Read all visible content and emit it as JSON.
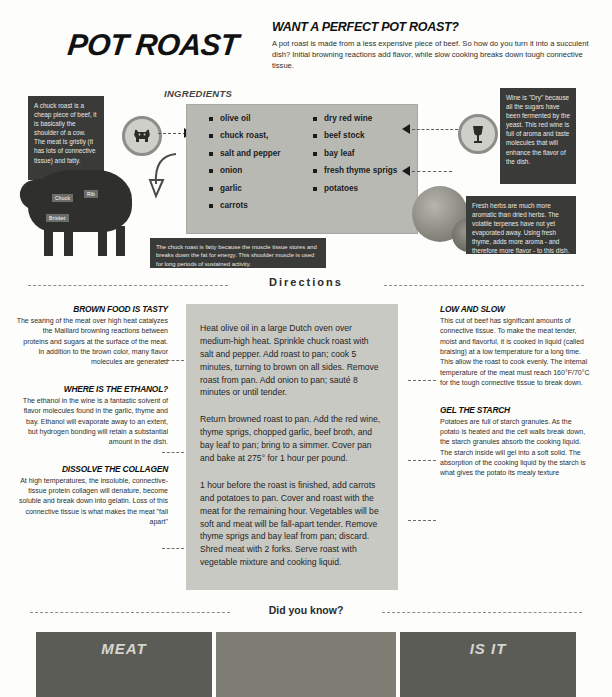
{
  "header": {
    "title": "POT ROAST",
    "intro_heading": "WANT A PERFECT POT ROAST?",
    "intro_body": "A pot roast is made from a less expensive piece of beef. So how do you turn it into a succulent dish? Initial browning reactions add flavor, while slow cooking breaks down tough connective tissue."
  },
  "ingredients": {
    "label": "INGREDIENTS",
    "column_left": [
      "olive oil",
      "chuck roast,",
      "salt and pepper",
      "onion",
      "garlic",
      "carrots"
    ],
    "column_right": [
      "dry red wine",
      "beef stock",
      "bay leaf",
      "fresh thyme sprigs",
      "potatoes"
    ]
  },
  "callouts": {
    "chuck": "A chuck roast is a cheap piece of beef, it is basically the shoulder of a cow. The meat is gristly (it has lots of connective tissue) and fatty.",
    "wine": "Wine is \"Dry\" because all the sugars have been fermented by the yeast. This red wine is full of aroma and taste molecules that will enhance the flavor of the dish.",
    "herbs": "Fresh herbs are much more aromatic than dried herbs. The volatile terpenes have not yet evaporated away. Using fresh thyme, adds more aroma - and therefore more flavor - to this dish.",
    "fat": "The chuck roast is fatty because the muscle tissue stores and breaks down the fat for energy. This shoulder muscle is used for long periods of sustained activity."
  },
  "cow_labels": {
    "chuck": "Chuck",
    "rib": "Rib",
    "brisket": "Brisket"
  },
  "icons": {
    "cow": "cow-icon",
    "wine": "wine-glass-icon"
  },
  "directions": {
    "divider_label": "Directions",
    "steps": [
      "Heat olive oil in a large Dutch oven over medium-high heat. Sprinkle chuck roast with salt and pepper. Add roast to pan; cook 5 minutes, turning to brown on all sides. Remove roast from pan. Add onion to pan; sauté 8 minutes or until tender.",
      "Return browned roast to pan. Add the red wine, thyme sprigs, chopped garlic, beef broth, and bay leaf to pan; bring to a simmer. Cover pan and bake at 275° for 1 hour per pound.",
      "1 hour before the roast is finished, add carrots and potatoes to pan. Cover and roast with the meat for the remaining hour. Vegetables will be soft and meat will be fall-apart tender. Remove thyme sprigs and bay leaf from pan; discard. Shred meat with 2 forks. Serve roast with vegetable mixture and cooking liquid."
    ]
  },
  "science_left": [
    {
      "heading": "BROWN FOOD IS TASTY",
      "body": "The searing of the meat over high heat catalyzes the Maillard browning reactions between proteins and sugars at the surface of the meat. In addition to the brown color, many flavor molecules are generated"
    },
    {
      "heading": "WHERE IS THE ETHANOL?",
      "body": "The ethanol in the wine is a fantastic solvent of flavor molecules found in the garlic, thyme and bay. Ethanol will evaporate away to an extent, but hydrogen bonding will retain a substantial amount in the dish."
    },
    {
      "heading": "DISSOLVE THE COLLAGEN",
      "body": "At high temperatures, the insoluble, connective-tissue protein collagen will denature, become soluble and break down into gelatin. Loss of this connective tissue is what makes the meat \"fall apart\""
    }
  ],
  "science_right": [
    {
      "heading": "LOW AND SLOW",
      "body": "This cut of beef has significant amounts of connective tissue. To make the meat tender, moist and flavorful, it is cooked in liquid (called braising) at a low temperature for a long time. This allow the roast to cook evenly. The internal temperature of the meat must reach 160°F/70°C for the tough connective tissue to break down."
    },
    {
      "heading": "GEL THE STARCH",
      "body": "Potatoes are full of starch granules. As the potato is heated and the cell walls break down, the starch granules absorb the cooking liquid. The starch inside will gel into a soft solid. The absorption of the cooking liquid by the starch is what gives the potato its mealy texture"
    }
  ],
  "footer": {
    "divider_label": "Did you know?",
    "panel_left_title": "MEAT",
    "panel_right_title": "IS IT"
  }
}
